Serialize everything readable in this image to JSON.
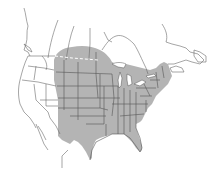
{
  "map": {
    "type": "range-map",
    "region": "North America",
    "colors": {
      "background": "#ffffff",
      "range_fill": "#b4b4b4",
      "state_border": "#555555",
      "coastline": "#6a6a6a",
      "border_dashed": "#ffffff"
    },
    "layers": [
      {
        "name": "range",
        "description": "Shaded range covering central and eastern United States and southern Canadian prairies"
      },
      {
        "name": "state-borders",
        "description": "US state and Canadian province boundaries"
      },
      {
        "name": "us-canada-border",
        "description": "Dashed white line through shaded area"
      }
    ]
  }
}
